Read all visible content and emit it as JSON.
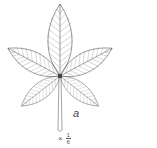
{
  "figure": {
    "label": "a",
    "scale": {
      "prefix": "×",
      "numerator": "1",
      "denominator": "6"
    },
    "colors": {
      "line": "#555555",
      "background": "#ffffff"
    }
  }
}
